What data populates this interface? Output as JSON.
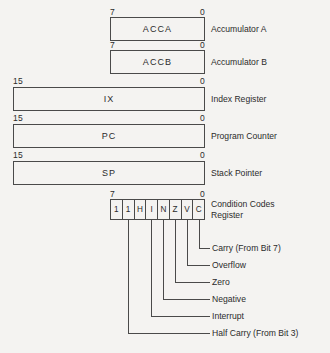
{
  "registers": [
    {
      "name": "ACCA",
      "description": "Accumulator A",
      "msb": "7",
      "lsb": "0",
      "width": "byte"
    },
    {
      "name": "ACCB",
      "description": "Accumulator B",
      "msb": "7",
      "lsb": "0",
      "width": "byte"
    },
    {
      "name": "IX",
      "description": "Index Register",
      "msb": "15",
      "lsb": "0",
      "width": "word"
    },
    {
      "name": "PC",
      "description": "Program Counter",
      "msb": "15",
      "lsb": "0",
      "width": "word"
    },
    {
      "name": "SP",
      "description": "Stack Pointer",
      "msb": "15",
      "lsb": "0",
      "width": "word"
    }
  ],
  "ccr": {
    "msb": "7",
    "lsb": "0",
    "description_line1": "Condition Codes",
    "description_line2": "Register",
    "bits": [
      "1",
      "1",
      "H",
      "I",
      "N",
      "Z",
      "V",
      "C"
    ]
  },
  "flags": [
    {
      "bit": "C",
      "label": "Carry (From Bit 7)"
    },
    {
      "bit": "V",
      "label": "Overflow"
    },
    {
      "bit": "Z",
      "label": "Zero"
    },
    {
      "bit": "N",
      "label": "Negative"
    },
    {
      "bit": "I",
      "label": "Interrupt"
    },
    {
      "bit": "H",
      "label": "Half Carry (From Bit 3)"
    }
  ],
  "colors": {
    "background": "#f4f3f1",
    "line": "#4a4a4a",
    "text": "#2b2b2b"
  }
}
